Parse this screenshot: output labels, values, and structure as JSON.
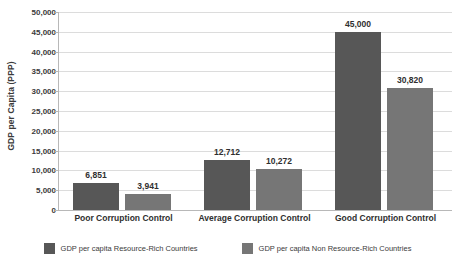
{
  "chart_data": {
    "type": "bar",
    "title": "",
    "subtitle": "",
    "xlabel": "",
    "ylabel": "GDP per Capita (PPP)",
    "ylim": [
      0,
      50000
    ],
    "grid": "horizontal",
    "legend_position": "bottom",
    "categories": [
      "Poor Corruption Control",
      "Average Corruption Control",
      "Good Corruption Control"
    ],
    "y_ticks": [
      "0",
      "5,000",
      "10,000",
      "15,000",
      "20,000",
      "25,000",
      "30,000",
      "35,000",
      "40,000",
      "45,000",
      "50,000"
    ],
    "y_tick_values": [
      0,
      5000,
      10000,
      15000,
      20000,
      25000,
      30000,
      35000,
      40000,
      45000,
      50000
    ],
    "series": [
      {
        "name": "GDP per capita Resource-Rich Countries",
        "color": "#575757",
        "values": [
          6851,
          12712,
          45000
        ],
        "labels": [
          "6,851",
          "12,712",
          "45,000"
        ]
      },
      {
        "name": "GDP per capita Non Resource-Rich Countries",
        "color": "#767676",
        "values": [
          3941,
          10272,
          30820
        ],
        "labels": [
          "3,941",
          "10,272",
          "30,820"
        ]
      }
    ]
  },
  "colors": {
    "series_a": "#575757",
    "series_b": "#767676",
    "gridline": "#dcdcdc",
    "axis": "#b8b8b8",
    "text": "#3b3b3b",
    "label_text": "#2f2f2f",
    "background": "#ffffff"
  }
}
